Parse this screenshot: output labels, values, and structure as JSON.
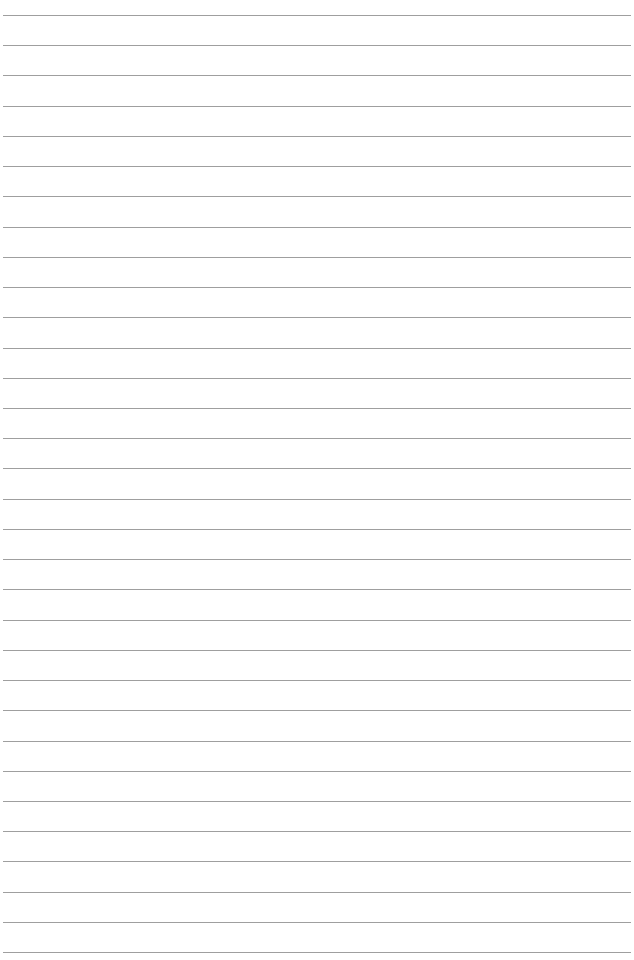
{
  "document": {
    "type": "lined-paper",
    "background_color": "#ffffff",
    "line_color": "#8e8e8e",
    "line_count": 32,
    "first_line_y": 15,
    "line_spacing": 30.23,
    "line_left": 3,
    "line_width": 628
  }
}
